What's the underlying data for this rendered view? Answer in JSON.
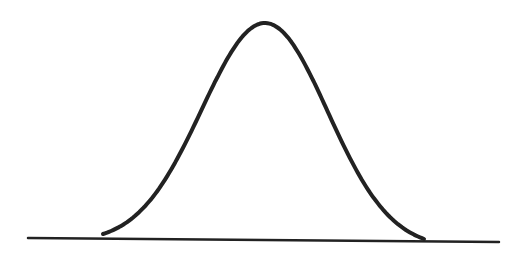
{
  "diagram": {
    "type": "bell-curve",
    "canvas": {
      "width": 520,
      "height": 254,
      "background": "#ffffff"
    },
    "stroke_color": "#222222",
    "curve": {
      "stroke_width": 4,
      "start": [
        103,
        234
      ],
      "peak": [
        265,
        23
      ],
      "end": [
        424,
        239
      ],
      "sample_points": [
        [
          103,
          234
        ],
        [
          157,
          200
        ],
        [
          230,
          60
        ],
        [
          265,
          23
        ],
        [
          298,
          60
        ],
        [
          377,
          200
        ],
        [
          424,
          239
        ]
      ]
    },
    "baseline": {
      "stroke_width": 2.5,
      "x1": 28,
      "y1": 238,
      "x2": 499,
      "y2": 242
    }
  }
}
